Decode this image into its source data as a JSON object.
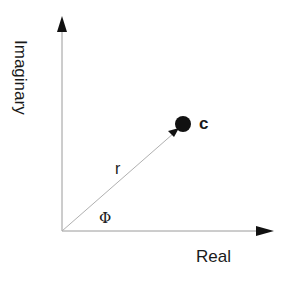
{
  "diagram": {
    "type": "complex-plane-polar",
    "labels": {
      "y_axis": "Imaginary",
      "x_axis": "Real",
      "point": "c",
      "magnitude": "r",
      "angle": "Φ"
    },
    "colors": {
      "axis": "#9a9a9a",
      "arrowhead": "#111111",
      "vector": "#b0b0b0",
      "point": "#111111",
      "text": "#1a1a1a"
    },
    "geometry": {
      "origin": [
        62,
        231
      ],
      "x_axis_end": [
        273,
        231
      ],
      "y_axis_end": [
        62,
        16
      ],
      "point_center": [
        183,
        124
      ],
      "point_radius": 8
    }
  }
}
